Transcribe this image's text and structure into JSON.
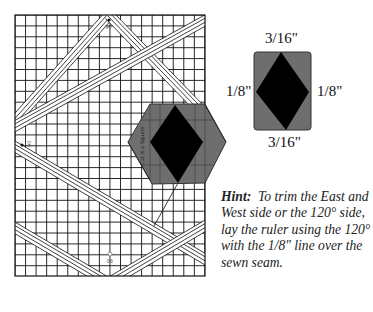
{
  "figure": {
    "type": "quilting-ruler-diagram",
    "grid_ruler": {
      "angle_labels": {
        "top": "90",
        "left": "90",
        "bottom": "90"
      },
      "ruler_text": "Cut in a Square",
      "colors": {
        "grid": "#111111",
        "background": "#ffffff",
        "hexagon": "#6e6e6e",
        "diamond": "#000000"
      }
    },
    "detail_shape": {
      "top_label": "3/16\"",
      "bottom_label": "3/16\"",
      "left_label": "1/8\"",
      "right_label": "1/8\"",
      "colors": {
        "background": "#6e6e6e",
        "diamond": "#000000"
      }
    },
    "hint": {
      "label": "Hint:",
      "text": "To trim the East and West side or the 120° side, lay the ruler using the 120° with the 1/8\" line over the sewn seam."
    }
  }
}
